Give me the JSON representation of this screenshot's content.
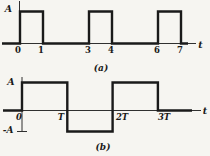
{
  "page": {
    "bg": "#f6f5f1",
    "ink": "#1a1a1a"
  },
  "chart_data": [
    {
      "id": "a",
      "type": "line",
      "subtype": "rectangular-pulse-train",
      "caption": "(a)",
      "xlabel": "t",
      "ylabel": "A",
      "x_ticks": [
        "0",
        "1",
        "3",
        "4",
        "6",
        "7"
      ],
      "tick_units": [
        0,
        1,
        3,
        4,
        6,
        7
      ],
      "ylim": [
        0,
        1
      ],
      "grid": false,
      "points": [
        [
          0,
          0
        ],
        [
          0,
          1
        ],
        [
          1,
          1
        ],
        [
          1,
          0
        ],
        [
          3,
          0
        ],
        [
          3,
          1
        ],
        [
          4,
          1
        ],
        [
          4,
          0
        ],
        [
          6,
          0
        ],
        [
          6,
          1
        ],
        [
          7,
          1
        ],
        [
          7,
          0
        ]
      ],
      "description": "Unipolar pulse train of amplitude A: high on 0-1, 3-4, 6-7, zero elsewhere"
    },
    {
      "id": "b",
      "type": "line",
      "subtype": "bipolar-square-wave",
      "caption": "(b)",
      "xlabel": "t",
      "ylabel_pos": "A",
      "ylabel_neg": "-A",
      "x_ticks": [
        "0",
        "T",
        "2T",
        "3T"
      ],
      "tick_units": [
        0,
        1,
        2,
        3
      ],
      "ylim": [
        -1,
        1
      ],
      "grid": false,
      "points": [
        [
          0,
          0
        ],
        [
          0,
          1
        ],
        [
          1,
          1
        ],
        [
          1,
          -1
        ],
        [
          2,
          -1
        ],
        [
          2,
          1
        ],
        [
          3,
          1
        ],
        [
          3,
          0
        ]
      ],
      "description": "Bipolar square wave: +A on 0-T, -A on T-2T, +A on 2T-3T, zero after 3T"
    }
  ]
}
